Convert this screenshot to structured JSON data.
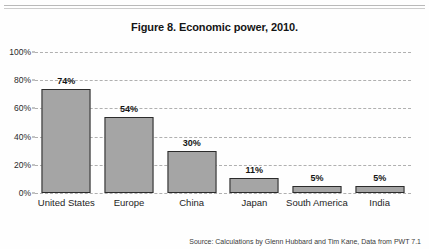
{
  "figure": {
    "title": "Figure 8. Economic power, 2010.",
    "source": "Source: Calculations by Glenn Hubbard and Tim Kane, Data from PWT 7.1"
  },
  "chart_data": {
    "type": "bar",
    "title": "Figure 8. Economic power, 2010.",
    "xlabel": "",
    "ylabel": "",
    "ylim": [
      0,
      100
    ],
    "yticks": [
      0,
      20,
      40,
      60,
      80,
      100
    ],
    "ytick_labels": [
      "0%",
      "20%",
      "40%",
      "60%",
      "80%",
      "100%"
    ],
    "grid": true,
    "legend": null,
    "categories": [
      "United States",
      "Europe",
      "China",
      "Japan",
      "South America",
      "India"
    ],
    "values": [
      74,
      54,
      30,
      11,
      5,
      5
    ],
    "value_labels": [
      "74%",
      "54%",
      "30%",
      "11%",
      "5%",
      "5%"
    ],
    "bar_color": "#a5a5a5",
    "bar_border_color": "#2b2b2b",
    "annotation": "Source: Calculations by Glenn Hubbard and Tim Kane, Data from PWT 7.1"
  }
}
